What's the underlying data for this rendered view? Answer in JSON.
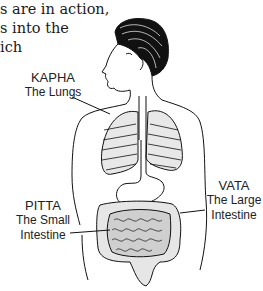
{
  "paragraph": {
    "lines": [
      "s are in action,",
      "s into the",
      "ich"
    ]
  },
  "labels": {
    "kapha": {
      "title": "KAPHA",
      "lines": [
        "The Lungs"
      ]
    },
    "pitta": {
      "title": "PITTA",
      "lines": [
        "The Small",
        "Intestine"
      ]
    },
    "vata": {
      "title": "VATA",
      "lines": [
        "The Large",
        "Intestine"
      ]
    }
  }
}
